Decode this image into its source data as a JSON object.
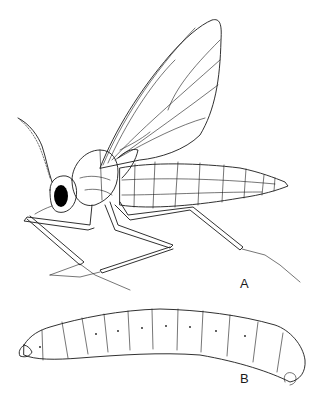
{
  "figure": {
    "panels": [
      {
        "id": "A",
        "label": "A",
        "subject": "adult-insect-lateral-view"
      },
      {
        "id": "B",
        "label": "B",
        "subject": "larva-lateral-view"
      }
    ],
    "colors": {
      "line": "#1a1a1a",
      "background": "#ffffff",
      "eye": "#000000",
      "larva_head": "#8a8a8a"
    },
    "signature": "Fx"
  }
}
